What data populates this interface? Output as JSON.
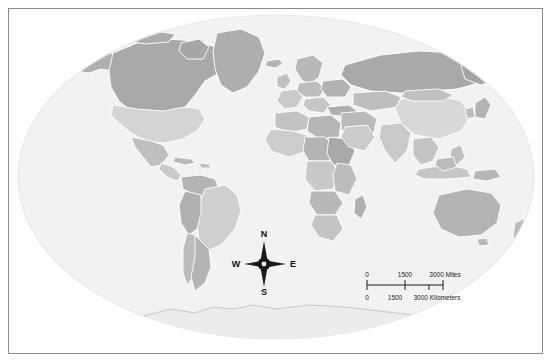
{
  "map": {
    "title": "World Map",
    "projection": "winkel-tripel",
    "ocean_color": "#f2f2f2",
    "background_color": "#ffffff",
    "border_color": "#8c8c8c",
    "country_border_color": "#ffffff",
    "coast_color": "#9a9a9a",
    "land_shades": [
      "#a9a9a9",
      "#b4b4b4",
      "#bfbfbf",
      "#c9c9c9",
      "#d4d4d4",
      "#dedede",
      "#e6e6e6",
      "#9e9e9e"
    ]
  },
  "compass": {
    "name": "compass-rose",
    "north": "N",
    "east": "E",
    "south": "S",
    "west": "W"
  },
  "scale": {
    "miles": {
      "unit_label": "3000 Miles",
      "ticks": [
        "0",
        "1500",
        "3000 Miles"
      ],
      "values": [
        0,
        1500,
        3000
      ]
    },
    "kilometers": {
      "unit_label": "3000 Kilometers",
      "ticks": [
        "0",
        "1500",
        "3000 Kilometers"
      ],
      "values": [
        0,
        1500,
        3000
      ]
    }
  },
  "regions": [
    {
      "name": "Canada",
      "shade": "#a9a9a9"
    },
    {
      "name": "United States",
      "shade": "#d4d4d4"
    },
    {
      "name": "Greenland",
      "shade": "#aeaeae"
    },
    {
      "name": "Mexico",
      "shade": "#bfbfbf"
    },
    {
      "name": "Brazil",
      "shade": "#cfcfcf"
    },
    {
      "name": "Argentina",
      "shade": "#b4b4b4"
    },
    {
      "name": "Russia",
      "shade": "#a9a9a9"
    },
    {
      "name": "China",
      "shade": "#d8d8d8"
    },
    {
      "name": "India",
      "shade": "#c9c9c9"
    },
    {
      "name": "Australia",
      "shade": "#b4b4b4"
    },
    {
      "name": "Antarctica",
      "shade": "#ececec"
    },
    {
      "name": "Africa",
      "shade": "#bfbfbf"
    },
    {
      "name": "Europe",
      "shade": "#c4c4c4"
    }
  ]
}
